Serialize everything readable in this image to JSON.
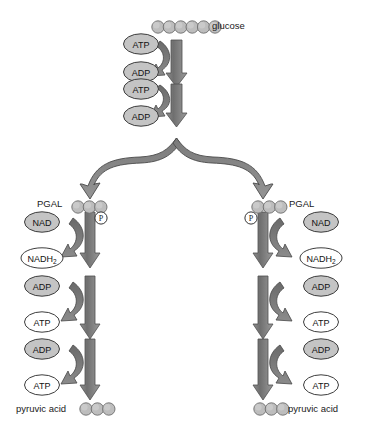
{
  "diagram": {
    "background_color": "#ffffff",
    "colors": {
      "arrow_gray": "#7d7d7d",
      "arrow_dark": "#5f5f5f",
      "arrow_outline": "#4a4a4a",
      "circle_fill": "#bdbdbd",
      "circle_stroke": "#6e6e6e",
      "ellipse_filled": "#c4c4c4",
      "ellipse_empty": "#ffffff",
      "ellipse_stroke": "#3d3d3d",
      "text": "#1a1a1a"
    }
  },
  "top": {
    "substrate": {
      "label": "glucose",
      "carbon_count": 6
    },
    "steps": [
      {
        "donor": "ATP",
        "product": "ADP",
        "donor_filled": true,
        "product_filled": true
      },
      {
        "donor": "ATP",
        "product": "ADP",
        "donor_filled": true,
        "product_filled": true
      }
    ]
  },
  "branches": [
    {
      "side": "left",
      "intermediate": {
        "label": "PGAL",
        "carbon_count": 3,
        "phosphate": "P"
      },
      "steps": [
        {
          "donor": "NAD",
          "product": "NADH2",
          "product_display": "NADH",
          "product_sub": "2",
          "donor_filled": true,
          "product_filled": false
        },
        {
          "donor": "ADP",
          "product": "ATP",
          "donor_filled": true,
          "product_filled": false
        },
        {
          "donor": "ADP",
          "product": "ATP",
          "donor_filled": true,
          "product_filled": false
        }
      ],
      "product": {
        "label": "pyruvic acid",
        "carbon_count": 3
      }
    },
    {
      "side": "right",
      "intermediate": {
        "label": "PGAL",
        "carbon_count": 3,
        "phosphate": "P"
      },
      "steps": [
        {
          "donor": "NAD",
          "product": "NADH2",
          "product_display": "NADH",
          "product_sub": "2",
          "donor_filled": true,
          "product_filled": false
        },
        {
          "donor": "ADP",
          "product": "ATP",
          "donor_filled": true,
          "product_filled": false
        },
        {
          "donor": "ADP",
          "product": "ATP",
          "donor_filled": true,
          "product_filled": false
        }
      ],
      "product": {
        "label": "pyruvic acid",
        "carbon_count": 3
      }
    }
  ]
}
